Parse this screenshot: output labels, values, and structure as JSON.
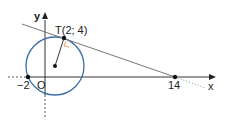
{
  "diagram": {
    "axes": {
      "x_label": "x",
      "y_label": "y",
      "origin_label": "O"
    },
    "points": {
      "tangent_point": "T(2; 4)",
      "left_intercept": "−2",
      "tangent_x_intercept": "14"
    },
    "colors": {
      "circle": "#3a6ea8",
      "right_angle": "#e8a060",
      "axis": "#333333",
      "line": "#666666"
    }
  }
}
